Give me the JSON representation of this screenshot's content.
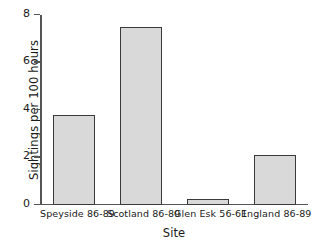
{
  "chart_data": {
    "type": "bar",
    "title": "",
    "categories": [
      "Speyside 86-89",
      "Scotland 86-89",
      "Glen Esk 56-61",
      "England 86-89"
    ],
    "values": [
      3.8,
      7.5,
      0.25,
      2.1
    ],
    "xlabel": "Site",
    "ylabel": "Sightings per 100 hours",
    "ylim": [
      0,
      8
    ],
    "yticks": [
      0,
      2,
      4,
      6,
      8
    ],
    "ytick_labels": [
      "0",
      "2",
      "4",
      "6",
      "8"
    ],
    "grid": false,
    "legend": null,
    "bar_fill_color": "#d9d9d9",
    "bar_edge_color": "#3a3a3a",
    "axis_color": "#555555",
    "background_color": "#ffffff"
  }
}
